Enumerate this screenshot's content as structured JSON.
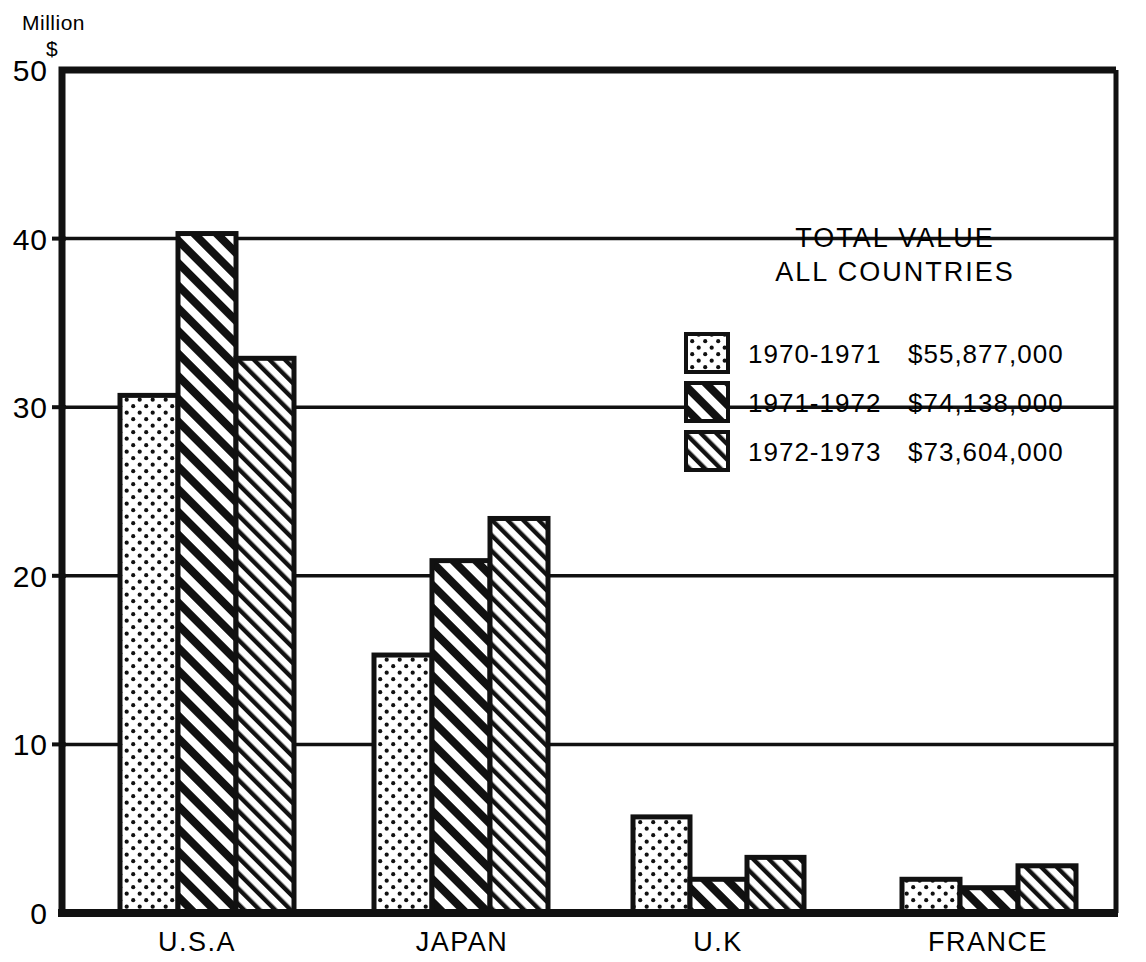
{
  "chart_data": {
    "type": "bar",
    "title": "",
    "xlabel": "",
    "ylabel": "Million $",
    "ylim": [
      0,
      50
    ],
    "yticks": [
      0,
      10,
      20,
      30,
      40,
      50
    ],
    "ytick_labels": [
      "0",
      "10",
      "20",
      "30",
      "40",
      "50"
    ],
    "grid": true,
    "grid_axis": "y",
    "legend_position": "upper right",
    "categories": [
      "U.S.A",
      "JAPAN",
      "U.K",
      "FRANCE"
    ],
    "series": [
      {
        "name": "1970-1971",
        "pattern": "dots",
        "values": [
          30.7,
          15.3,
          5.7,
          2.0
        ]
      },
      {
        "name": "1971-1972",
        "pattern": "hatch-bold",
        "values": [
          40.3,
          20.9,
          2.0,
          1.5
        ]
      },
      {
        "name": "1972-1973",
        "pattern": "hatch-fine",
        "values": [
          32.9,
          23.4,
          3.3,
          2.8
        ]
      }
    ],
    "annotations": {
      "total_title_line1": "TOTAL VALUE",
      "total_title_line2": "ALL COUNTRIES",
      "totals": [
        "$55,877,000",
        "$74,138,000",
        "$73,604,000"
      ]
    }
  },
  "axis": {
    "unit_line1": "Million",
    "unit_line2": "$"
  },
  "legend": {
    "entries": [
      {
        "label": "1970-1971",
        "total": "$55,877,000"
      },
      {
        "label": "1971-1972",
        "total": "$74,138,000"
      },
      {
        "label": "1972-1973",
        "total": "$73,604,000"
      }
    ]
  },
  "colors": {
    "ink": "#111111",
    "background": "#ffffff"
  }
}
